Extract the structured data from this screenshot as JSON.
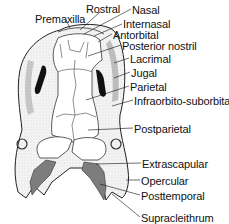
{
  "diagram": {
    "labels": [
      {
        "id": "premaxilla",
        "text": "Premaxilla",
        "x": 35,
        "y": 13
      },
      {
        "id": "rostral",
        "text": "Rostral",
        "x": 86,
        "y": 3
      },
      {
        "id": "nasal",
        "text": "Nasal",
        "x": 132,
        "y": 4
      },
      {
        "id": "internasal",
        "text": "Internasal",
        "x": 123,
        "y": 18
      },
      {
        "id": "antorbital",
        "text": "Antorbital",
        "x": 113,
        "y": 29
      },
      {
        "id": "posterior_nostril",
        "text": "Posterior nostril",
        "x": 122,
        "y": 40
      },
      {
        "id": "lacrimal",
        "text": "Lacrimal",
        "x": 130,
        "y": 53
      },
      {
        "id": "jugal",
        "text": "Jugal",
        "x": 131,
        "y": 67
      },
      {
        "id": "parietal",
        "text": "Parietal",
        "x": 130,
        "y": 81
      },
      {
        "id": "infraorbito_suborbital",
        "text": "Infraorbito-suborbital",
        "x": 134,
        "y": 95
      },
      {
        "id": "postparietal",
        "text": "Postparietal",
        "x": 134,
        "y": 123
      },
      {
        "id": "extrascapular",
        "text": "Extrascapular",
        "x": 142,
        "y": 158
      },
      {
        "id": "opercular",
        "text": "Opercular",
        "x": 141,
        "y": 175
      },
      {
        "id": "posttemporal",
        "text": "Posttemporal",
        "x": 141,
        "y": 190
      },
      {
        "id": "supracleithrum",
        "text": "Supracleithrum",
        "x": 141,
        "y": 212
      }
    ]
  }
}
